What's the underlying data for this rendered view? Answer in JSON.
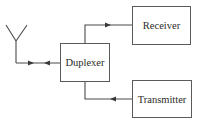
{
  "diagram": {
    "title": "",
    "blocks": {
      "duplexer": {
        "label": "Duplexer"
      },
      "receiver": {
        "label": "Receiver"
      },
      "transmitter": {
        "label": "Transmitter"
      }
    },
    "icons": {
      "antenna": "antenna-icon"
    },
    "connections": [
      {
        "from": "antenna",
        "to": "duplexer",
        "direction": "bidirectional"
      },
      {
        "from": "duplexer",
        "to": "receiver",
        "direction": "forward"
      },
      {
        "from": "transmitter",
        "to": "duplexer",
        "direction": "forward"
      }
    ],
    "colors": {
      "line": "#4a4a4a",
      "background": "#ffffff",
      "text": "#2a2a2a"
    }
  }
}
